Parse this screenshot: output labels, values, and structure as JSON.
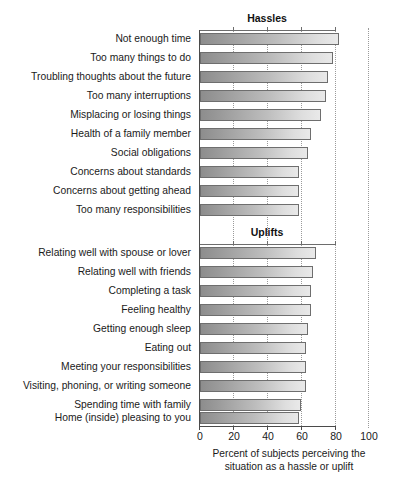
{
  "chart_data": {
    "type": "bar",
    "title": "",
    "orientation": "horizontal",
    "xlabel": "Percent of subjects perceiving the situation as a hassle or uplift",
    "ylabel": "",
    "xlim": [
      0,
      100
    ],
    "xticks": [
      0,
      20,
      40,
      60,
      80,
      100
    ],
    "grid": "vertical dotted gridlines at 20, 40, 60, 80, 100",
    "legend": "none",
    "panels": [
      {
        "title": "Hassles",
        "categories": [
          "Not enough time",
          "Too many things to do",
          "Troubling thoughts about the future",
          "Too many interruptions",
          "Misplacing or losing things",
          "Health of a family member",
          "Social obligations",
          "Concerns about standards",
          "Concerns about getting ahead",
          "Too many responsibilities"
        ],
        "values": [
          83,
          79,
          76,
          75,
          72,
          66,
          64,
          59,
          59,
          59
        ]
      },
      {
        "title": "Uplifts",
        "categories": [
          "Relating well with spouse or lover",
          "Relating well with friends",
          "Completing a task",
          "Feeling healthy",
          "Getting enough sleep",
          "Eating out",
          "Meeting your responsibilities",
          "Visiting, phoning, or writing someone",
          "Spending time with family",
          "Home (inside) pleasing to you"
        ],
        "values": [
          69,
          67,
          66,
          66,
          64,
          63,
          63,
          63,
          60,
          59
        ]
      }
    ]
  },
  "axis": {
    "tick_labels": [
      "0",
      "20",
      "40",
      "60",
      "80",
      "100"
    ],
    "caption_line1": "Percent of subjects perceiving the",
    "caption_line2": "situation as a hassle or uplift"
  },
  "colors": {
    "bar_dark": "#8d8d8d",
    "bar_light": "#e9e9e9",
    "bar_border": "#6e6e6e",
    "axis": "#4a4a4a",
    "grid": "#9a9a9a",
    "text": "#1a1a1a",
    "background": "#ffffff"
  }
}
